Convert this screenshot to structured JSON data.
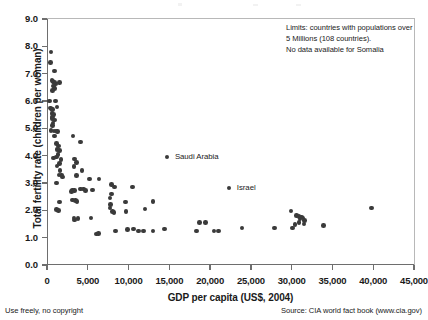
{
  "chart_data": {
    "type": "scatter",
    "title": "",
    "xlabel": "GDP per capita (US$, 2004)",
    "ylabel": "Total fertility rate (children per woman)",
    "xlim": [
      0,
      45000
    ],
    "ylim": [
      0,
      9.0
    ],
    "xticks": [
      0,
      5000,
      10000,
      15000,
      20000,
      25000,
      30000,
      35000,
      40000,
      45000
    ],
    "xtick_labels": [
      "0",
      "5,000",
      "10,000",
      "15,000",
      "20,000",
      "25,000",
      "30,000",
      "35,000",
      "40,000",
      "45,000"
    ],
    "yticks": [
      0.0,
      1.0,
      2.0,
      3.0,
      4.0,
      5.0,
      6.0,
      7.0,
      8.0,
      9.0
    ],
    "ytick_labels": [
      "0.0",
      "1.0",
      "2.0",
      "3.0",
      "4.0",
      "5.0",
      "6.0",
      "7.0",
      "8.0",
      "9.0"
    ],
    "grid": false,
    "legend": null,
    "marker_color": "#3a3a3a",
    "annotations": [
      {
        "name": "limits-note",
        "lines": [
          "Limits: countries with populations over",
          "5 Millions (108 countries).",
          "No data available for Somalia"
        ],
        "x": 28000,
        "y": 8.6
      }
    ],
    "labeled_points": [
      {
        "label": "Saudi Arabia",
        "x": 14700,
        "y": 3.95
      },
      {
        "label": "Israel",
        "x": 22300,
        "y": 2.82
      }
    ],
    "points": [
      [
        500,
        7.8
      ],
      [
        420,
        7.4
      ],
      [
        900,
        7.1
      ],
      [
        600,
        6.75
      ],
      [
        750,
        6.72
      ],
      [
        900,
        6.68
      ],
      [
        1050,
        6.62
      ],
      [
        800,
        6.55
      ],
      [
        1500,
        6.68
      ],
      [
        950,
        6.45
      ],
      [
        700,
        6.38
      ],
      [
        300,
        6.0
      ],
      [
        1050,
        6.0
      ],
      [
        420,
        5.75
      ],
      [
        520,
        5.7
      ],
      [
        700,
        5.68
      ],
      [
        1250,
        5.78
      ],
      [
        600,
        5.55
      ],
      [
        800,
        5.5
      ],
      [
        700,
        5.42
      ],
      [
        620,
        5.35
      ],
      [
        900,
        5.3
      ],
      [
        750,
        5.2
      ],
      [
        650,
        5.1
      ],
      [
        500,
        4.92
      ],
      [
        850,
        4.9
      ],
      [
        1100,
        4.9
      ],
      [
        1300,
        4.88
      ],
      [
        950,
        4.72
      ],
      [
        3200,
        4.72
      ],
      [
        4100,
        4.5
      ],
      [
        1150,
        4.45
      ],
      [
        1400,
        4.35
      ],
      [
        1250,
        4.22
      ],
      [
        1500,
        4.18
      ],
      [
        1350,
        4.05
      ],
      [
        1150,
        3.95
      ],
      [
        800,
        3.92
      ],
      [
        1700,
        3.85
      ],
      [
        3400,
        3.88
      ],
      [
        1500,
        3.72
      ],
      [
        1250,
        3.62
      ],
      [
        3600,
        3.75
      ],
      [
        3300,
        3.6
      ],
      [
        1600,
        3.45
      ],
      [
        4300,
        3.45
      ],
      [
        1450,
        3.3
      ],
      [
        1750,
        3.3
      ],
      [
        1900,
        3.22
      ],
      [
        3600,
        3.28
      ],
      [
        1150,
        3.0
      ],
      [
        5200,
        3.15
      ],
      [
        6400,
        3.15
      ],
      [
        7900,
        2.95
      ],
      [
        3100,
        2.75
      ],
      [
        3400,
        2.72
      ],
      [
        4100,
        2.78
      ],
      [
        4500,
        2.78
      ],
      [
        4700,
        2.72
      ],
      [
        5600,
        2.75
      ],
      [
        8300,
        2.85
      ],
      [
        10500,
        2.85
      ],
      [
        3000,
        2.68
      ],
      [
        7900,
        2.6
      ],
      [
        7700,
        2.45
      ],
      [
        3100,
        2.38
      ],
      [
        3500,
        2.35
      ],
      [
        3700,
        2.32
      ],
      [
        1500,
        2.3
      ],
      [
        9600,
        2.3
      ],
      [
        13000,
        2.32
      ],
      [
        7800,
        2.22
      ],
      [
        12000,
        2.05
      ],
      [
        7700,
        2.08
      ],
      [
        8000,
        1.95
      ],
      [
        9700,
        1.95
      ],
      [
        8200,
        1.92
      ],
      [
        1200,
        2.02
      ],
      [
        1400,
        2.0
      ],
      [
        3300,
        1.72
      ],
      [
        3400,
        1.65
      ],
      [
        3800,
        1.7
      ],
      [
        5400,
        1.72
      ],
      [
        18700,
        1.55
      ],
      [
        19400,
        1.55
      ],
      [
        29900,
        1.98
      ],
      [
        30600,
        1.82
      ],
      [
        30900,
        1.78
      ],
      [
        31200,
        1.75
      ],
      [
        31000,
        1.68
      ],
      [
        31400,
        1.72
      ],
      [
        31600,
        1.62
      ],
      [
        30900,
        1.55
      ],
      [
        31500,
        1.5
      ],
      [
        30400,
        1.48
      ],
      [
        39800,
        2.08
      ],
      [
        6100,
        1.13
      ],
      [
        6300,
        1.15
      ],
      [
        8400,
        1.25
      ],
      [
        9900,
        1.3
      ],
      [
        10600,
        1.32
      ],
      [
        11200,
        1.25
      ],
      [
        11800,
        1.25
      ],
      [
        13000,
        1.25
      ],
      [
        14400,
        1.32
      ],
      [
        18300,
        1.25
      ],
      [
        20500,
        1.25
      ],
      [
        21000,
        1.25
      ],
      [
        23900,
        1.35
      ],
      [
        27900,
        1.35
      ],
      [
        30100,
        1.35
      ],
      [
        33900,
        1.45
      ]
    ]
  },
  "footer": {
    "left": "Use freely, no copyright",
    "right": "Source: CIA world fact book (www.cia.gov)"
  }
}
